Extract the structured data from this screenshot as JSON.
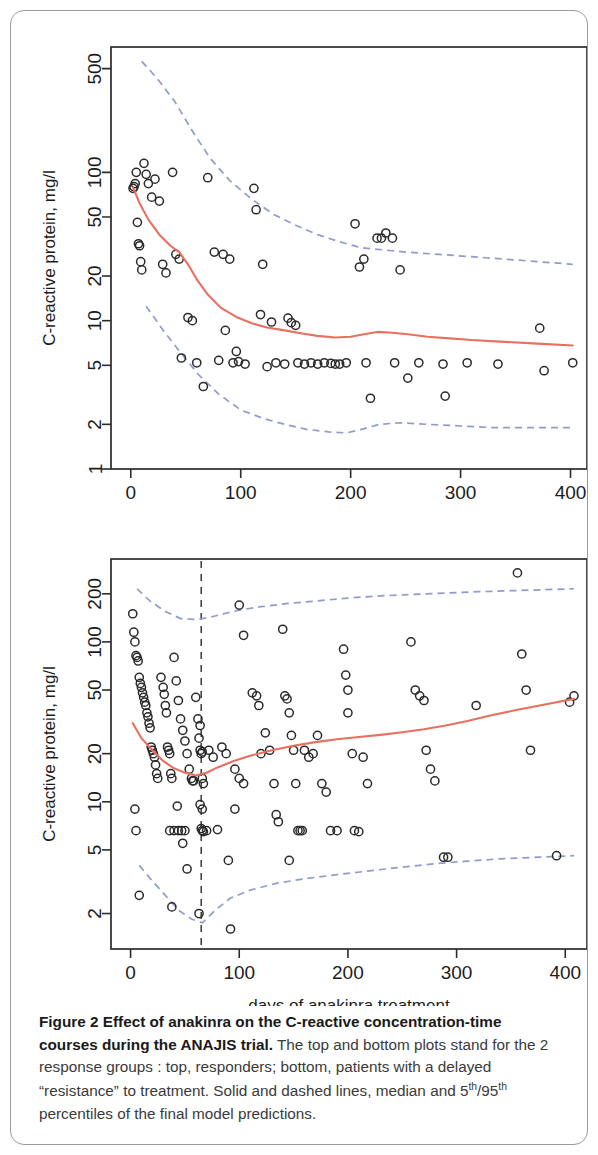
{
  "figure": {
    "caption_bold": "Figure 2 Effect of anakinra on the C-reactive concentration-time courses during the ANAJIS trial.",
    "caption_rest": " The top and bottom plots stand for the 2 response groups : top, responders; bottom, patients with a delayed “resistance” to treatment. Solid and dashed lines, median and ",
    "caption_sup1": "th",
    "caption_mid": "/95",
    "caption_sup2": "th",
    "caption_tail": " percentiles of the final model predictions.",
    "caption_p5": "5",
    "colors": {
      "median_line": "#e8705f",
      "percentile_line": "#8f9ccc",
      "point_stroke": "#2a2a2a",
      "axis": "#2b2b2b",
      "vline": "#3a3a3a"
    }
  },
  "chart_data": [
    {
      "type": "scatter",
      "panel": "top",
      "panel_label": "responders",
      "title": "",
      "xlabel": "",
      "ylabel": "C-reactive protein, mg/l",
      "xlim": [
        -18,
        415
      ],
      "ylim": [
        1,
        700
      ],
      "yscale": "log",
      "xticks": [
        0,
        100,
        200,
        300,
        400
      ],
      "yticks": [
        1,
        2,
        5,
        10,
        20,
        50,
        100,
        500
      ],
      "grid": false,
      "legend": null,
      "points": [
        [
          2,
          78
        ],
        [
          3,
          80
        ],
        [
          4,
          84
        ],
        [
          5,
          100
        ],
        [
          6,
          46
        ],
        [
          7,
          33
        ],
        [
          8,
          32
        ],
        [
          9,
          25
        ],
        [
          10,
          22
        ],
        [
          12,
          115
        ],
        [
          14,
          97
        ],
        [
          16,
          84
        ],
        [
          19,
          68
        ],
        [
          22,
          90
        ],
        [
          26,
          64
        ],
        [
          29,
          24
        ],
        [
          32,
          21
        ],
        [
          38,
          100
        ],
        [
          41,
          28
        ],
        [
          44,
          26
        ],
        [
          46,
          5.6
        ],
        [
          52,
          10.5
        ],
        [
          56,
          10.0
        ],
        [
          60,
          5.2
        ],
        [
          66,
          3.6
        ],
        [
          70,
          92
        ],
        [
          76,
          29
        ],
        [
          80,
          5.4
        ],
        [
          84,
          28
        ],
        [
          86,
          8.6
        ],
        [
          90,
          26
        ],
        [
          93,
          5.2
        ],
        [
          96,
          6.2
        ],
        [
          98,
          5.3
        ],
        [
          104,
          5.1
        ],
        [
          112,
          78
        ],
        [
          114,
          56
        ],
        [
          118,
          11.0
        ],
        [
          120,
          24
        ],
        [
          124,
          4.9
        ],
        [
          128,
          9.8
        ],
        [
          132,
          5.2
        ],
        [
          140,
          5.1
        ],
        [
          143,
          10.4
        ],
        [
          146,
          9.7
        ],
        [
          150,
          9.3
        ],
        [
          152,
          5.2
        ],
        [
          158,
          5.1
        ],
        [
          164,
          5.2
        ],
        [
          170,
          5.1
        ],
        [
          176,
          5.2
        ],
        [
          182,
          5.15
        ],
        [
          186,
          5.1
        ],
        [
          190,
          5.1
        ],
        [
          196,
          5.2
        ],
        [
          204,
          45
        ],
        [
          208,
          23
        ],
        [
          212,
          26
        ],
        [
          214,
          5.2
        ],
        [
          218,
          3.0
        ],
        [
          224,
          36
        ],
        [
          228,
          36
        ],
        [
          232,
          39
        ],
        [
          238,
          36
        ],
        [
          240,
          5.2
        ],
        [
          245,
          22
        ],
        [
          252,
          4.1
        ],
        [
          262,
          5.2
        ],
        [
          284,
          5.1
        ],
        [
          286,
          3.1
        ],
        [
          306,
          5.2
        ],
        [
          334,
          5.1
        ],
        [
          372,
          8.9
        ],
        [
          376,
          4.6
        ],
        [
          402,
          5.2
        ]
      ],
      "median_series": {
        "name": "median",
        "x": [
          2,
          8,
          16,
          26,
          36,
          44,
          52,
          60,
          70,
          82,
          96,
          110,
          124,
          140,
          156,
          170,
          186,
          200,
          212,
          224,
          238,
          252,
          270,
          290,
          310,
          340,
          370,
          402
        ],
        "y": [
          79,
          62,
          48,
          38,
          32,
          29,
          24,
          19,
          15,
          12.2,
          10.6,
          9.6,
          9.0,
          8.6,
          8.2,
          7.9,
          7.7,
          7.8,
          8.1,
          8.4,
          8.3,
          8.1,
          7.8,
          7.6,
          7.4,
          7.2,
          7.0,
          6.8
        ]
      },
      "percentile_upper": {
        "name": "95th percentile",
        "x": [
          10,
          24,
          40,
          56,
          72,
          90,
          110,
          130,
          150,
          170,
          190,
          210,
          230,
          250,
          280,
          310,
          340,
          370,
          402
        ],
        "y": [
          560,
          430,
          300,
          190,
          125,
          88,
          66,
          52,
          44,
          38,
          34,
          31,
          30,
          29,
          28,
          27,
          26,
          25,
          24
        ]
      },
      "percentile_lower": {
        "name": "5th percentile",
        "x": [
          14,
          30,
          46,
          62,
          80,
          100,
          120,
          140,
          160,
          180,
          196,
          210,
          226,
          245,
          270,
          300,
          330,
          366,
          402
        ],
        "y": [
          12.5,
          8.5,
          6.0,
          4.3,
          3.2,
          2.5,
          2.2,
          2.0,
          1.85,
          1.78,
          1.75,
          1.85,
          2.0,
          2.05,
          2.0,
          1.95,
          1.9,
          1.9,
          1.9
        ]
      }
    },
    {
      "type": "scatter",
      "panel": "bottom",
      "panel_label": "delayed resistance",
      "title": "",
      "xlabel": "days of anakinra treatment",
      "ylabel": "C-reactive protein, mg/l",
      "xlim": [
        -18,
        420
      ],
      "ylim": [
        1.2,
        330
      ],
      "yscale": "log",
      "xticks": [
        0,
        100,
        200,
        300,
        400
      ],
      "yticks": [
        2,
        5,
        10,
        20,
        50,
        100,
        200
      ],
      "grid": false,
      "legend": null,
      "vline_x": 65,
      "points": [
        [
          2,
          150
        ],
        [
          3,
          115
        ],
        [
          4,
          100
        ],
        [
          5,
          82
        ],
        [
          6,
          80
        ],
        [
          7,
          76
        ],
        [
          8,
          60
        ],
        [
          9,
          55
        ],
        [
          10,
          52
        ],
        [
          11,
          48
        ],
        [
          12,
          45
        ],
        [
          13,
          42
        ],
        [
          14,
          40
        ],
        [
          15,
          36
        ],
        [
          16,
          34
        ],
        [
          17,
          31
        ],
        [
          18,
          29
        ],
        [
          19,
          22
        ],
        [
          20,
          21
        ],
        [
          21,
          20
        ],
        [
          22,
          19
        ],
        [
          23,
          17
        ],
        [
          24,
          15
        ],
        [
          25,
          14
        ],
        [
          4,
          9.0
        ],
        [
          5,
          6.6
        ],
        [
          8,
          2.6
        ],
        [
          28,
          60
        ],
        [
          30,
          52
        ],
        [
          31,
          47
        ],
        [
          32,
          40
        ],
        [
          33,
          36
        ],
        [
          34,
          22
        ],
        [
          35,
          21
        ],
        [
          36,
          20
        ],
        [
          37,
          15
        ],
        [
          38,
          14
        ],
        [
          40,
          80
        ],
        [
          42,
          57
        ],
        [
          44,
          43
        ],
        [
          46,
          33
        ],
        [
          48,
          28
        ],
        [
          50,
          24
        ],
        [
          52,
          20
        ],
        [
          54,
          16
        ],
        [
          56,
          14
        ],
        [
          58,
          13.5
        ],
        [
          36,
          6.6
        ],
        [
          40,
          6.6
        ],
        [
          44,
          6.6
        ],
        [
          47,
          6.6
        ],
        [
          50,
          6.6
        ],
        [
          43,
          9.4
        ],
        [
          48,
          5.5
        ],
        [
          52,
          3.8
        ],
        [
          38,
          2.2
        ],
        [
          57,
          13.5
        ],
        [
          60,
          45
        ],
        [
          62,
          33
        ],
        [
          63,
          25
        ],
        [
          64,
          21
        ],
        [
          65,
          20
        ],
        [
          66,
          20.5
        ],
        [
          64,
          30
        ],
        [
          66,
          14
        ],
        [
          67,
          13
        ],
        [
          65,
          6.8
        ],
        [
          66,
          6.6
        ],
        [
          67,
          6.5
        ],
        [
          64,
          9.6
        ],
        [
          66,
          9.0
        ],
        [
          63,
          2.0
        ],
        [
          70,
          6.6
        ],
        [
          72,
          21
        ],
        [
          76,
          19
        ],
        [
          80,
          6.7
        ],
        [
          84,
          22
        ],
        [
          88,
          20
        ],
        [
          90,
          4.3
        ],
        [
          92,
          1.6
        ],
        [
          96,
          16
        ],
        [
          100,
          14
        ],
        [
          104,
          13
        ],
        [
          96,
          9.0
        ],
        [
          100,
          170
        ],
        [
          104,
          110
        ],
        [
          112,
          48
        ],
        [
          116,
          46
        ],
        [
          118,
          40
        ],
        [
          120,
          20
        ],
        [
          124,
          27
        ],
        [
          128,
          21
        ],
        [
          132,
          13
        ],
        [
          134,
          8.3
        ],
        [
          136,
          7.5
        ],
        [
          140,
          120
        ],
        [
          142,
          46
        ],
        [
          144,
          44
        ],
        [
          146,
          36
        ],
        [
          148,
          26
        ],
        [
          150,
          21
        ],
        [
          152,
          13
        ],
        [
          154,
          6.6
        ],
        [
          156,
          6.6
        ],
        [
          158,
          6.6
        ],
        [
          146,
          4.3
        ],
        [
          160,
          21
        ],
        [
          164,
          19
        ],
        [
          168,
          20
        ],
        [
          172,
          26
        ],
        [
          176,
          13
        ],
        [
          180,
          11.5
        ],
        [
          184,
          6.6
        ],
        [
          190,
          6.6
        ],
        [
          196,
          90
        ],
        [
          198,
          62
        ],
        [
          200,
          50
        ],
        [
          200,
          36
        ],
        [
          204,
          20
        ],
        [
          206,
          6.6
        ],
        [
          210,
          6.5
        ],
        [
          214,
          19
        ],
        [
          218,
          13
        ],
        [
          258,
          100
        ],
        [
          262,
          50
        ],
        [
          266,
          46
        ],
        [
          270,
          43
        ],
        [
          272,
          21
        ],
        [
          276,
          16
        ],
        [
          280,
          13.5
        ],
        [
          288,
          4.5
        ],
        [
          292,
          4.5
        ],
        [
          318,
          40
        ],
        [
          356,
          270
        ],
        [
          360,
          84
        ],
        [
          364,
          50
        ],
        [
          368,
          21
        ],
        [
          392,
          4.6
        ],
        [
          404,
          42
        ],
        [
          408,
          46
        ]
      ],
      "median_series": {
        "name": "median",
        "x": [
          2,
          10,
          20,
          30,
          40,
          50,
          60,
          70,
          80,
          95,
          110,
          130,
          150,
          170,
          190,
          210,
          230,
          250,
          270,
          290,
          310,
          330,
          355,
          380,
          408
        ],
        "y": [
          31,
          25,
          21,
          18,
          16.2,
          15.2,
          14.6,
          15.2,
          16.4,
          18.0,
          19.4,
          21.0,
          22.4,
          23.6,
          24.6,
          25.4,
          26.2,
          27.2,
          28.4,
          30.0,
          32.0,
          34.5,
          37.5,
          40.5,
          44.0
        ]
      },
      "percentile_upper": {
        "name": "95th percentile",
        "x": [
          6,
          18,
          32,
          46,
          60,
          72,
          86,
          100,
          120,
          145,
          170,
          200,
          230,
          260,
          290,
          320,
          350,
          380,
          408
        ],
        "y": [
          215,
          180,
          155,
          140,
          138,
          142,
          150,
          158,
          166,
          174,
          180,
          188,
          194,
          198,
          202,
          206,
          209,
          212,
          215
        ]
      },
      "percentile_lower": {
        "name": "5th percentile",
        "x": [
          8,
          20,
          32,
          44,
          56,
          66,
          78,
          92,
          110,
          135,
          160,
          190,
          220,
          250,
          280,
          310,
          340,
          375,
          408
        ],
        "y": [
          4.0,
          3.2,
          2.6,
          2.1,
          1.85,
          1.75,
          2.1,
          2.5,
          2.8,
          3.1,
          3.3,
          3.5,
          3.7,
          3.9,
          4.1,
          4.25,
          4.4,
          4.5,
          4.6
        ]
      }
    }
  ]
}
